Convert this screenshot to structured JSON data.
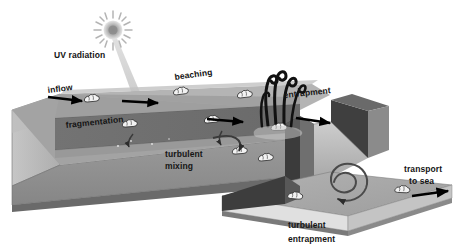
{
  "figure": {
    "type": "schematic-3d-block-diagram",
    "palette": {
      "background": "#ffffff",
      "water_surface": "#9a9a9a",
      "water_surface_far": "#8c8c8c",
      "river_channel_dark": "#6d6d6d",
      "bank_top_light": "#b4b4b4",
      "bank_face_mid": "#a0a0a0",
      "block_front_face": "#8f8f8f",
      "block_bottom_edge": "#6a6a6a",
      "block_left_cap": "#b8b8b8",
      "estuary_wall_dark": "#3a3a3a",
      "sea_surface": "#a8a8a8",
      "sea_side": "#dcdcdc",
      "sea_bottom_edge": "#777777",
      "plastic_debris": "#f2f2f2",
      "plastic_outline": "#2a2a2a",
      "vegetation": "#111111",
      "arrow": "#000000",
      "sun_glow": "#b9b9b9",
      "text": "#151515"
    }
  },
  "labels": {
    "uv_radiation": "UV radiation",
    "inflow": "inflow",
    "fragmentation": "fragmentation",
    "beaching": "beaching",
    "entrapment": "entrapment",
    "turbulent_mixing_line1": "turbulent",
    "turbulent_mixing_line2": "mixing",
    "turbulent_entrapment_line1": "turbulent",
    "turbulent_entrapment_line2": "entrapment",
    "transport_line1": "transport",
    "transport_line2": "to sea"
  },
  "icons": {
    "sun": "sun-icon",
    "uv_beam": "uv-beam-icon",
    "vegetation": "reed-vegetation-icon",
    "vortex": "spiral-vortex-icon",
    "debris": "plastic-debris-icon",
    "flow_arrow": "flow-arrow-icon",
    "curved_arrow": "curved-arrow-icon"
  },
  "processes": [
    {
      "id": "uv-radiation",
      "label": "UV radiation",
      "zone": "atmosphere",
      "marker": "sun-icon"
    },
    {
      "id": "inflow",
      "label": "inflow",
      "zone": "upstream",
      "marker": "flow-arrow-icon"
    },
    {
      "id": "fragmentation",
      "label": "fragmentation",
      "zone": "upstream-bank",
      "marker": "plastic-debris-icon"
    },
    {
      "id": "beaching",
      "label": "beaching",
      "zone": "midstream-bank",
      "marker": "plastic-debris-icon"
    },
    {
      "id": "entrapment",
      "label": "entrapment",
      "zone": "vegetated-bank",
      "marker": "reed-vegetation-icon"
    },
    {
      "id": "turbulent-mixing",
      "label": "turbulent mixing",
      "zone": "channel",
      "marker": "curved-arrow-icon"
    },
    {
      "id": "turbulent-entrapment",
      "label": "turbulent entrapment",
      "zone": "river-mouth",
      "marker": "spiral-vortex-icon"
    },
    {
      "id": "transport-to-sea",
      "label": "transport to sea",
      "zone": "sea",
      "marker": "flow-arrow-icon"
    }
  ]
}
